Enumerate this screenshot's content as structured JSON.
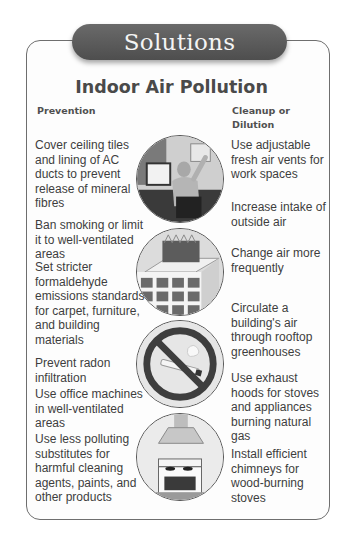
{
  "header": {
    "badge": "Solutions",
    "title": "Indoor Air Pollution"
  },
  "columns": {
    "prevention": {
      "heading": "Prevention",
      "items": [
        "Cover ceiling tiles and lining of AC ducts to prevent release of mineral fibres",
        "Ban smoking or limit it to well-ventilated areas",
        "Set stricter formaldehyde emissions standards for carpet, furniture, and building materials",
        "Prevent radon infiltration",
        "Use office machines in well-ventilated areas",
        "Use less polluting substitutes for harmful cleaning agents, paints, and other products"
      ]
    },
    "cleanup": {
      "heading": "Cleanup or Dilution",
      "items": [
        "Use adjustable fresh air vents for work spaces",
        "Increase intake of outside air",
        "Change air more frequently",
        "Circulate a building's air through rooftop greenhouses",
        "Use exhaust hoods for stoves and appliances burning natural gas",
        "Install efficient chimneys for wood-burning stoves"
      ]
    }
  },
  "images": [
    {
      "icon": "office-worker-icon",
      "description": "Person working at a computer desk near a wall vent"
    },
    {
      "icon": "rooftop-greenhouse-icon",
      "description": "Building with a rooftop greenhouse"
    },
    {
      "icon": "no-smoking-icon",
      "description": "No smoking sign over a cigarette"
    },
    {
      "icon": "stove-hood-icon",
      "description": "Stove with exhaust hood"
    }
  ],
  "colors": {
    "badge_bg": "#5a5a5a",
    "badge_text": "#f4f4f4",
    "border": "#6e6e6e",
    "text": "#3e3e3e"
  }
}
